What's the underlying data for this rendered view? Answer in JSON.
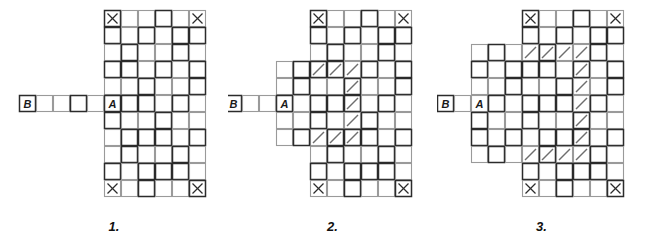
{
  "page": {
    "background_color": "#ffffff",
    "ink_color": "#1a1a1a",
    "grid_line_color": "#9a9a9a",
    "grid_line_dark_color": "#2b2b2b",
    "diagonal_color": "#6e6e6e",
    "cell_size": 17,
    "width": 646,
    "height": 242
  },
  "figures": [
    {
      "id": "figure-1",
      "caption": "1.",
      "left": 0,
      "width": 228,
      "origin_x": 104,
      "origin_y": 10,
      "main_grid": {
        "cols": 6,
        "rows": 11,
        "col_start": 0,
        "row_start": 0
      },
      "extension_blocks": [],
      "corner_marks": [
        {
          "col": 0,
          "row": 0,
          "mark": "x-mark"
        },
        {
          "col": 5,
          "row": 0,
          "mark": "x-mark"
        },
        {
          "col": 0,
          "row": 10,
          "mark": "x-mark"
        },
        {
          "col": 5,
          "row": 10,
          "mark": "x-mark"
        }
      ],
      "arm": {
        "row": 5,
        "cells": 5,
        "start_col": -5,
        "label_b": "B",
        "label_b_col": -5,
        "blank_cells": 4
      },
      "label_a": {
        "text": "A",
        "col": 0,
        "row": 5
      },
      "diagonals": []
    },
    {
      "id": "figure-2",
      "caption": "2.",
      "left": 228,
      "width": 209,
      "origin_x": 310,
      "origin_y": 10,
      "main_grid": {
        "cols": 6,
        "rows": 11,
        "col_start": 0,
        "row_start": 0
      },
      "extension_blocks": [
        {
          "name": "left-extension",
          "col_start": -2,
          "col_end": -1,
          "row_start": 3,
          "row_end": 7
        }
      ],
      "corner_marks": [
        {
          "col": 0,
          "row": 0,
          "mark": "x-mark"
        },
        {
          "col": 5,
          "row": 0,
          "mark": "x-mark"
        },
        {
          "col": 0,
          "row": 10,
          "mark": "x-mark"
        },
        {
          "col": 5,
          "row": 10,
          "mark": "x-mark"
        }
      ],
      "arm": {
        "row": 5,
        "cells": 3,
        "start_col": -5,
        "label_b": "B",
        "label_b_col": -5,
        "blank_cells": 2
      },
      "label_a": {
        "text": "A",
        "col": -2,
        "row": 5
      },
      "diagonals": [
        {
          "col": 0,
          "row": 3
        },
        {
          "col": 1,
          "row": 3
        },
        {
          "col": 2,
          "row": 3
        },
        {
          "col": 2,
          "row": 4
        },
        {
          "col": 2,
          "row": 5
        },
        {
          "col": 2,
          "row": 6
        },
        {
          "col": 2,
          "row": 7
        },
        {
          "col": 1,
          "row": 7
        },
        {
          "col": 0,
          "row": 7
        }
      ]
    },
    {
      "id": "figure-3",
      "caption": "3.",
      "left": 437,
      "width": 209,
      "origin_x": 522,
      "origin_y": 10,
      "main_grid": {
        "cols": 6,
        "rows": 11,
        "col_start": 0,
        "row_start": 0
      },
      "extension_blocks": [
        {
          "name": "left-extension",
          "col_start": -3,
          "col_end": -1,
          "row_start": 2,
          "row_end": 8
        }
      ],
      "corner_marks": [
        {
          "col": 0,
          "row": 0,
          "mark": "x-mark"
        },
        {
          "col": 5,
          "row": 0,
          "mark": "x-mark"
        },
        {
          "col": 0,
          "row": 10,
          "mark": "x-mark"
        },
        {
          "col": 5,
          "row": 10,
          "mark": "x-mark"
        }
      ],
      "arm": {
        "row": 5,
        "cells": 2,
        "start_col": -5,
        "label_b": "B",
        "label_b_col": -5,
        "blank_cells": 1
      },
      "label_a": {
        "text": "A",
        "col": -3,
        "row": 5
      },
      "diagonals": [
        {
          "col": 0,
          "row": 2
        },
        {
          "col": 1,
          "row": 2
        },
        {
          "col": 2,
          "row": 2
        },
        {
          "col": 3,
          "row": 2
        },
        {
          "col": 3,
          "row": 3
        },
        {
          "col": 3,
          "row": 4
        },
        {
          "col": 3,
          "row": 5
        },
        {
          "col": 3,
          "row": 6
        },
        {
          "col": 3,
          "row": 7
        },
        {
          "col": 3,
          "row": 8
        },
        {
          "col": 2,
          "row": 8
        },
        {
          "col": 1,
          "row": 8
        },
        {
          "col": 0,
          "row": 8
        }
      ]
    }
  ]
}
